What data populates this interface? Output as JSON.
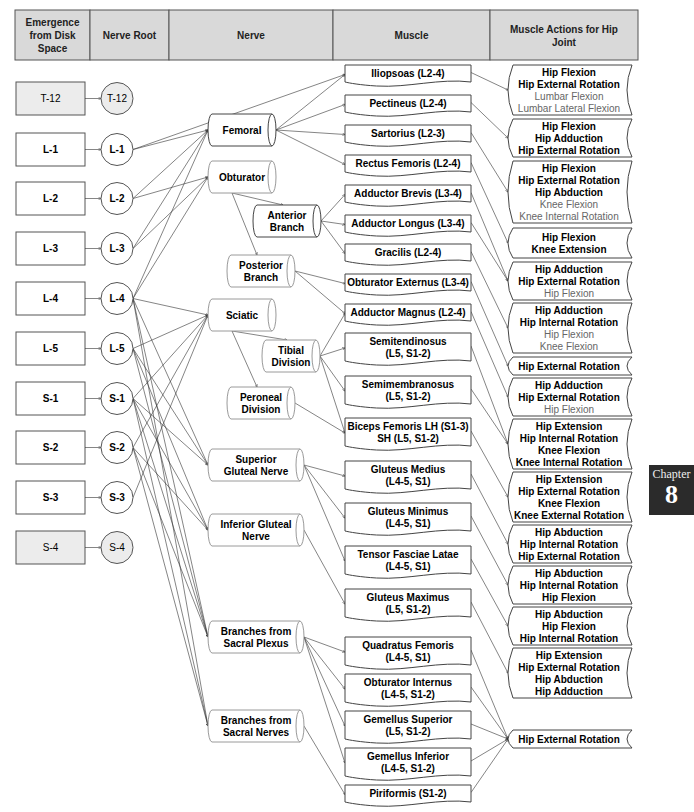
{
  "headers": [
    {
      "label": "Emergence from Disk Space",
      "lines": [
        "Emergence",
        "from Disk",
        "Space"
      ],
      "x": 15,
      "w": 75
    },
    {
      "label": "Nerve Root",
      "lines": [
        "Nerve Root"
      ],
      "x": 90,
      "w": 79
    },
    {
      "label": "Nerve",
      "lines": [
        "Nerve"
      ],
      "x": 169,
      "w": 164
    },
    {
      "label": "Muscle",
      "lines": [
        "Muscle"
      ],
      "x": 333,
      "w": 157
    },
    {
      "label": "Muscle Actions for Hip Joint",
      "lines": [
        "Muscle Actions for Hip",
        "Joint"
      ],
      "x": 490,
      "w": 148
    }
  ],
  "colors": {
    "header_bg": "#d9d9d9",
    "muted_bg": "#ececec",
    "border": "#555555",
    "light_text": "#666666",
    "chapter_bg": "#2b2b2b"
  },
  "disk_spaces": [
    {
      "id": "T-12",
      "label": "T-12",
      "y": 82,
      "muted": true
    },
    {
      "id": "L-1",
      "label": "L-1",
      "y": 133,
      "muted": false
    },
    {
      "id": "L-2",
      "label": "L-2",
      "y": 182,
      "muted": false
    },
    {
      "id": "L-3",
      "label": "L-3",
      "y": 232,
      "muted": false
    },
    {
      "id": "L-4",
      "label": "L-4",
      "y": 282,
      "muted": false
    },
    {
      "id": "L-5",
      "label": "L-5",
      "y": 332,
      "muted": false
    },
    {
      "id": "S-1",
      "label": "S-1",
      "y": 382,
      "muted": false
    },
    {
      "id": "S-2",
      "label": "S-2",
      "y": 431,
      "muted": false
    },
    {
      "id": "S-3",
      "label": "S-3",
      "y": 481,
      "muted": false
    },
    {
      "id": "S-4",
      "label": "S-4",
      "y": 531,
      "muted": true
    }
  ],
  "nerve_roots": [
    {
      "id": "T-12",
      "label": "T-12",
      "muted": true
    },
    {
      "id": "L-1",
      "label": "L-1",
      "muted": false
    },
    {
      "id": "L-2",
      "label": "L-2",
      "muted": false
    },
    {
      "id": "L-3",
      "label": "L-3",
      "muted": false
    },
    {
      "id": "L-4",
      "label": "L-4",
      "muted": false
    },
    {
      "id": "L-5",
      "label": "L-5",
      "muted": false
    },
    {
      "id": "S-1",
      "label": "S-1",
      "muted": false
    },
    {
      "id": "S-2",
      "label": "S-2",
      "muted": false
    },
    {
      "id": "S-3",
      "label": "S-3",
      "muted": false
    },
    {
      "id": "S-4",
      "label": "S-4",
      "muted": true
    }
  ],
  "nerves": [
    {
      "id": "femoral",
      "lines": [
        "Femoral"
      ],
      "x": 208,
      "y": 114,
      "w": 68,
      "h": 32,
      "lite": false
    },
    {
      "id": "obturator",
      "lines": [
        "Obturator"
      ],
      "x": 208,
      "y": 161,
      "w": 68,
      "h": 32,
      "lite": true
    },
    {
      "id": "anterior",
      "lines": [
        "Anterior",
        "Branch"
      ],
      "x": 253,
      "y": 205,
      "w": 68,
      "h": 32,
      "lite": false
    },
    {
      "id": "posterior",
      "lines": [
        "Posterior",
        "Branch"
      ],
      "x": 227,
      "y": 255,
      "w": 68,
      "h": 32,
      "lite": true
    },
    {
      "id": "sciatic",
      "lines": [
        "Sciatic"
      ],
      "x": 208,
      "y": 299,
      "w": 68,
      "h": 32,
      "lite": true
    },
    {
      "id": "tibial",
      "lines": [
        "Tibial",
        "Division"
      ],
      "x": 262,
      "y": 340,
      "w": 58,
      "h": 32,
      "lite": true
    },
    {
      "id": "peroneal",
      "lines": [
        "Peroneal",
        "Division"
      ],
      "x": 227,
      "y": 387,
      "w": 68,
      "h": 32,
      "lite": true
    },
    {
      "id": "sup_gluteal",
      "lines": [
        "Superior",
        "Gluteal Nerve"
      ],
      "x": 208,
      "y": 449,
      "w": 96,
      "h": 32,
      "lite": true
    },
    {
      "id": "inf_gluteal",
      "lines": [
        "Inferior Gluteal",
        "Nerve"
      ],
      "x": 208,
      "y": 514,
      "w": 96,
      "h": 32,
      "lite": true
    },
    {
      "id": "sacral_plexus",
      "lines": [
        "Branches from",
        "Sacral Plexus"
      ],
      "x": 208,
      "y": 621,
      "w": 96,
      "h": 32,
      "lite": true
    },
    {
      "id": "sacral_nerves",
      "lines": [
        "Branches from",
        "Sacral Nerves"
      ],
      "x": 208,
      "y": 710,
      "w": 96,
      "h": 32,
      "lite": true
    }
  ],
  "muscles": [
    {
      "id": "iliopsoas",
      "lines": [
        "Iliopsoas (L2-4)"
      ],
      "y": 65,
      "h": 19
    },
    {
      "id": "pectineus",
      "lines": [
        "Pectineus (L2-4)"
      ],
      "y": 95,
      "h": 19
    },
    {
      "id": "sartorius",
      "lines": [
        "Sartorius (L2-3)"
      ],
      "y": 125,
      "h": 19
    },
    {
      "id": "rectus_femoris",
      "lines": [
        "Rectus Femoris (L2-4)"
      ],
      "y": 155,
      "h": 19
    },
    {
      "id": "adductor_brevis",
      "lines": [
        "Adductor Brevis (L3-4)"
      ],
      "y": 185,
      "h": 19
    },
    {
      "id": "adductor_longus",
      "lines": [
        "Adductor Longus (L3-4)"
      ],
      "y": 215,
      "h": 19
    },
    {
      "id": "gracilis",
      "lines": [
        "Gracilis (L2-4)"
      ],
      "y": 244,
      "h": 19
    },
    {
      "id": "obturator_externus",
      "lines": [
        "Obturator Externus (L3-4)"
      ],
      "y": 274,
      "h": 19
    },
    {
      "id": "adductor_magnus",
      "lines": [
        "Adductor Magnus (L2-4)"
      ],
      "y": 304,
      "h": 19
    },
    {
      "id": "semitendinosus",
      "lines": [
        "Semitendinosus",
        "(L5, S1-2)"
      ],
      "y": 333,
      "h": 30
    },
    {
      "id": "semimembranosus",
      "lines": [
        "Semimembranosus",
        "(L5, S1-2)"
      ],
      "y": 376,
      "h": 30
    },
    {
      "id": "biceps_femoris",
      "lines": [
        "Biceps Femoris LH (S1-3)",
        "SH (L5, S1-2)"
      ],
      "y": 418,
      "h": 30
    },
    {
      "id": "gluteus_medius",
      "lines": [
        "Gluteus Medius",
        "(L4-5, S1)"
      ],
      "y": 461,
      "h": 30
    },
    {
      "id": "gluteus_minimus",
      "lines": [
        "Gluteus Minimus",
        "(L4-5, S1)"
      ],
      "y": 503,
      "h": 30
    },
    {
      "id": "tensor_fasciae_latae",
      "lines": [
        "Tensor Fasciae Latae",
        "(L4-5, S1)"
      ],
      "y": 546,
      "h": 30
    },
    {
      "id": "gluteus_maximus",
      "lines": [
        "Gluteus Maximus",
        "(L5, S1-2)"
      ],
      "y": 589,
      "h": 30
    },
    {
      "id": "quadratus_femoris",
      "lines": [
        "Quadratus Femoris",
        "(L4-5, S1)"
      ],
      "y": 637,
      "h": 30
    },
    {
      "id": "obturator_internus",
      "lines": [
        "Obturator Internus",
        "(L4-5, S1-2)"
      ],
      "y": 674,
      "h": 30
    },
    {
      "id": "gemellus_superior",
      "lines": [
        "Gemellus Superior",
        "(L5, S1-2)"
      ],
      "y": 711,
      "h": 30
    },
    {
      "id": "gemellus_inferior",
      "lines": [
        "Gemellus Inferior",
        "(L4-5, S1-2)"
      ],
      "y": 748,
      "h": 30
    },
    {
      "id": "piriformis",
      "lines": [
        "Piriformis (S1-2)"
      ],
      "y": 785,
      "h": 19
    }
  ],
  "actions": [
    {
      "id": "a_iliopsoas",
      "y": 65,
      "h": 50,
      "items": [
        {
          "text": "Hip Flexion",
          "primary": true
        },
        {
          "text": "Hip External Rotation",
          "primary": true
        },
        {
          "text": "Lumbar Flexion",
          "primary": false
        },
        {
          "text": "Lumbar Lateral Flexion",
          "primary": false
        }
      ]
    },
    {
      "id": "a_pectineus",
      "y": 119,
      "h": 38,
      "items": [
        {
          "text": "Hip Flexion",
          "primary": true
        },
        {
          "text": "Hip Adduction",
          "primary": true
        },
        {
          "text": "Hip External Rotation",
          "primary": true
        }
      ]
    },
    {
      "id": "a_sartorius",
      "y": 161,
      "h": 62,
      "items": [
        {
          "text": "Hip Flexion",
          "primary": true
        },
        {
          "text": "Hip External Rotation",
          "primary": true
        },
        {
          "text": "Hip Abduction",
          "primary": true
        },
        {
          "text": "Knee Flexion",
          "primary": false
        },
        {
          "text": "Knee Internal Rotation",
          "primary": false
        }
      ]
    },
    {
      "id": "a_rectus",
      "y": 228,
      "h": 30,
      "items": [
        {
          "text": "Hip Flexion",
          "primary": true
        },
        {
          "text": "Knee Extension",
          "primary": true
        }
      ]
    },
    {
      "id": "a_adductors",
      "y": 262,
      "h": 38,
      "items": [
        {
          "text": "Hip Adduction",
          "primary": true
        },
        {
          "text": "Hip External Rotation",
          "primary": true
        },
        {
          "text": "Hip Flexion",
          "primary": false
        }
      ]
    },
    {
      "id": "a_gracilis",
      "y": 303,
      "h": 50,
      "items": [
        {
          "text": "Hip Adduction",
          "primary": true
        },
        {
          "text": "Hip Internal Rotation",
          "primary": true
        },
        {
          "text": "Hip Flexion",
          "primary": false
        },
        {
          "text": "Knee Flexion",
          "primary": false
        }
      ]
    },
    {
      "id": "a_obt_ext",
      "y": 357,
      "h": 18,
      "items": [
        {
          "text": "Hip External Rotation",
          "primary": true
        }
      ]
    },
    {
      "id": "a_add_magnus",
      "y": 378,
      "h": 38,
      "items": [
        {
          "text": "Hip Adduction",
          "primary": true
        },
        {
          "text": "Hip External Rotation",
          "primary": true
        },
        {
          "text": "Hip Flexion",
          "primary": false
        }
      ]
    },
    {
      "id": "a_semis",
      "y": 419,
      "h": 50,
      "items": [
        {
          "text": "Hip Extension",
          "primary": true
        },
        {
          "text": "Hip Internal Rotation",
          "primary": true
        },
        {
          "text": "Knee Flexion",
          "primary": true
        },
        {
          "text": "Knee Internal Rotation",
          "primary": true
        }
      ]
    },
    {
      "id": "a_biceps",
      "y": 472,
      "h": 50,
      "items": [
        {
          "text": "Hip Extension",
          "primary": true
        },
        {
          "text": "Hip External Rotation",
          "primary": true
        },
        {
          "text": "Knee Flexion",
          "primary": true
        },
        {
          "text": "Knee External Rotation",
          "primary": true
        }
      ]
    },
    {
      "id": "a_glut_med",
      "y": 525,
      "h": 38,
      "items": [
        {
          "text": "Hip Abduction",
          "primary": true
        },
        {
          "text": "Hip Internal Rotation",
          "primary": true
        },
        {
          "text": "Hip External Rotation",
          "primary": true
        }
      ]
    },
    {
      "id": "a_glut_min",
      "y": 566,
      "h": 38,
      "items": [
        {
          "text": "Hip Abduction",
          "primary": true
        },
        {
          "text": "Hip Internal Rotation",
          "primary": true
        },
        {
          "text": "Hip Flexion",
          "primary": true
        }
      ]
    },
    {
      "id": "a_tfl",
      "y": 607,
      "h": 38,
      "items": [
        {
          "text": "Hip Abduction",
          "primary": true
        },
        {
          "text": "Hip Flexion",
          "primary": true
        },
        {
          "text": "Hip Internal Rotation",
          "primary": true
        }
      ]
    },
    {
      "id": "a_glut_max",
      "y": 648,
      "h": 50,
      "items": [
        {
          "text": "Hip Extension",
          "primary": true
        },
        {
          "text": "Hip External Rotation",
          "primary": true
        },
        {
          "text": "Hip Abduction",
          "primary": true
        },
        {
          "text": "Hip Adduction",
          "primary": true
        }
      ]
    },
    {
      "id": "a_deep_rot",
      "y": 730,
      "h": 18,
      "items": [
        {
          "text": "Hip External Rotation",
          "primary": true
        }
      ]
    }
  ],
  "connections": {
    "root_to_nerve": [
      [
        "L-1",
        "femoral"
      ],
      [
        "L-2",
        "femoral"
      ],
      [
        "L-3",
        "femoral"
      ],
      [
        "L-4",
        "femoral"
      ],
      [
        "L-2",
        "obturator"
      ],
      [
        "L-3",
        "obturator"
      ],
      [
        "L-4",
        "obturator"
      ],
      [
        "L-4",
        "sciatic"
      ],
      [
        "L-5",
        "sciatic"
      ],
      [
        "S-1",
        "sciatic"
      ],
      [
        "S-2",
        "sciatic"
      ],
      [
        "S-3",
        "sciatic"
      ],
      [
        "L-4",
        "sup_gluteal"
      ],
      [
        "L-5",
        "sup_gluteal"
      ],
      [
        "S-1",
        "sup_gluteal"
      ],
      [
        "L-5",
        "inf_gluteal"
      ],
      [
        "S-1",
        "inf_gluteal"
      ],
      [
        "S-2",
        "inf_gluteal"
      ],
      [
        "L-4",
        "sacral_plexus"
      ],
      [
        "L-5",
        "sacral_plexus"
      ],
      [
        "S-1",
        "sacral_plexus"
      ],
      [
        "S-2",
        "sacral_plexus"
      ],
      [
        "L-4",
        "sacral_nerves"
      ],
      [
        "S-1",
        "sacral_nerves"
      ],
      [
        "S-2",
        "sacral_nerves"
      ]
    ],
    "nerve_to_nerve": [
      [
        "obturator",
        "anterior"
      ],
      [
        "obturator",
        "posterior"
      ],
      [
        "sciatic",
        "tibial"
      ],
      [
        "sciatic",
        "peroneal"
      ]
    ],
    "l1_to_muscle": [
      [
        "L-1",
        "iliopsoas"
      ]
    ],
    "nerve_to_muscle": [
      [
        "femoral",
        "iliopsoas"
      ],
      [
        "femoral",
        "pectineus"
      ],
      [
        "femoral",
        "sartorius"
      ],
      [
        "femoral",
        "rectus_femoris"
      ],
      [
        "anterior",
        "adductor_brevis"
      ],
      [
        "anterior",
        "adductor_longus"
      ],
      [
        "anterior",
        "gracilis"
      ],
      [
        "posterior",
        "obturator_externus"
      ],
      [
        "posterior",
        "adductor_magnus"
      ],
      [
        "tibial",
        "adductor_magnus"
      ],
      [
        "tibial",
        "semitendinosus"
      ],
      [
        "tibial",
        "semimembranosus"
      ],
      [
        "tibial",
        "biceps_femoris"
      ],
      [
        "peroneal",
        "biceps_femoris"
      ],
      [
        "sup_gluteal",
        "gluteus_medius"
      ],
      [
        "sup_gluteal",
        "gluteus_minimus"
      ],
      [
        "sup_gluteal",
        "tensor_fasciae_latae"
      ],
      [
        "inf_gluteal",
        "gluteus_maximus"
      ],
      [
        "sacral_plexus",
        "quadratus_femoris"
      ],
      [
        "sacral_plexus",
        "obturator_internus"
      ],
      [
        "sacral_plexus",
        "gemellus_superior"
      ],
      [
        "sacral_plexus",
        "gemellus_inferior"
      ],
      [
        "sacral_nerves",
        "piriformis"
      ]
    ],
    "muscle_to_action": [
      [
        "iliopsoas",
        "a_iliopsoas"
      ],
      [
        "pectineus",
        "a_pectineus"
      ],
      [
        "sartorius",
        "a_sartorius"
      ],
      [
        "rectus_femoris",
        "a_rectus"
      ],
      [
        "adductor_brevis",
        "a_adductors"
      ],
      [
        "adductor_longus",
        "a_adductors"
      ],
      [
        "gracilis",
        "a_gracilis"
      ],
      [
        "obturator_externus",
        "a_obt_ext"
      ],
      [
        "adductor_magnus",
        "a_add_magnus"
      ],
      [
        "semitendinosus",
        "a_semis"
      ],
      [
        "semimembranosus",
        "a_semis"
      ],
      [
        "biceps_femoris",
        "a_biceps"
      ],
      [
        "gluteus_medius",
        "a_glut_med"
      ],
      [
        "gluteus_minimus",
        "a_glut_min"
      ],
      [
        "tensor_fasciae_latae",
        "a_tfl"
      ],
      [
        "gluteus_maximus",
        "a_glut_max"
      ],
      [
        "quadratus_femoris",
        "a_deep_rot"
      ],
      [
        "obturator_internus",
        "a_deep_rot"
      ],
      [
        "gemellus_superior",
        "a_deep_rot"
      ],
      [
        "gemellus_inferior",
        "a_deep_rot"
      ],
      [
        "piriformis",
        "a_deep_rot"
      ]
    ]
  },
  "chapter_tab": {
    "label": "Chapter",
    "number": "8"
  }
}
